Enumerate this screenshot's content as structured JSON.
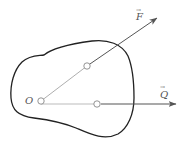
{
  "diagram": {
    "type": "mechanics-force-diagram",
    "labels": {
      "origin": "O",
      "force_f": "F",
      "force_q": "Q"
    },
    "vector_marks": {
      "force_f": "→",
      "force_q": "→"
    },
    "colors": {
      "outline": "#222222",
      "thin_line": "#999999",
      "arrow": "#555555",
      "point_fill": "#ffffff",
      "point_stroke": "#888888"
    },
    "points": [
      {
        "name": "O",
        "x": 41,
        "y": 101
      },
      {
        "name": "F-application",
        "x": 87,
        "y": 66
      },
      {
        "name": "Q-application",
        "x": 97,
        "y": 104
      }
    ],
    "arrows": [
      {
        "name": "F",
        "from": [
          87,
          66
        ],
        "to": [
          157,
          18
        ]
      },
      {
        "name": "Q",
        "from": [
          97,
          104
        ],
        "to": [
          176,
          104
        ]
      }
    ]
  }
}
